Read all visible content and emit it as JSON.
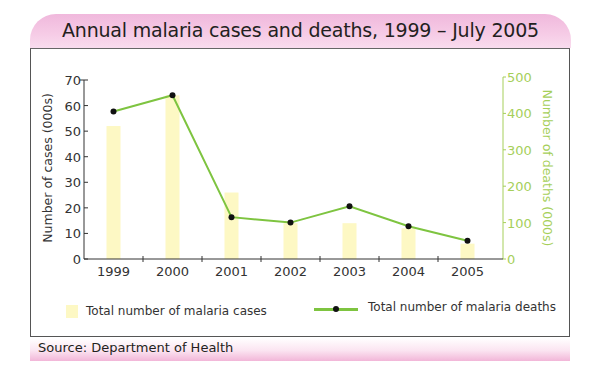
{
  "title": "Annual malaria cases and deaths, 1999 – July 2005",
  "source": "Source: Department of Health",
  "colors": {
    "header_pink": "#f4c2e2",
    "bar_fill": "#fdf8c4",
    "line": "#7ec440",
    "marker": "#111111",
    "right_axis": "#a6cf5a",
    "left_axis": "#333333"
  },
  "legend": {
    "cases_label": "Total number of malaria cases",
    "deaths_label": "Total number of malaria deaths"
  },
  "axes": {
    "left_label": "Number of cases  (000s)",
    "right_label": "Number of deaths (000s)",
    "left_ticks": [
      "0",
      "10",
      "20",
      "30",
      "40",
      "50",
      "60",
      "70"
    ],
    "right_ticks": [
      "0",
      "100",
      "200",
      "300",
      "400",
      "500"
    ],
    "x_ticks": [
      "1999",
      "2000",
      "2001",
      "2002",
      "2003",
      "2004",
      "2005"
    ]
  },
  "chart_data": {
    "type": "bar+line",
    "title": "Annual malaria cases and deaths, 1999 – July 2005",
    "categories": [
      "1999",
      "2000",
      "2001",
      "2002",
      "2003",
      "2004",
      "2005"
    ],
    "series": [
      {
        "name": "Total number of malaria cases",
        "type": "bar",
        "axis": "left",
        "values": [
          52,
          64,
          26,
          14,
          14,
          12,
          6
        ]
      },
      {
        "name": "Total number of malaria deaths",
        "type": "line",
        "axis": "right",
        "values": [
          405,
          450,
          115,
          100,
          145,
          90,
          50
        ]
      }
    ],
    "xlabel": "",
    "ylabel": "Number of cases (000s)",
    "y2label": "Number of deaths (000s)",
    "ylim": [
      0,
      70
    ],
    "y2lim": [
      0,
      500
    ],
    "grid": false,
    "legend_position": "bottom",
    "source": "Department of Health"
  }
}
